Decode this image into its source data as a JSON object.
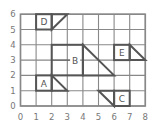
{
  "diagram": {
    "type": "grid-shapes",
    "x_ticks": [
      "0",
      "1",
      "2",
      "3",
      "4",
      "5",
      "6",
      "7",
      "8"
    ],
    "y_ticks": [
      "0",
      "1",
      "2",
      "3",
      "4",
      "5",
      "6"
    ],
    "grid": {
      "x_min": 0,
      "x_max": 8,
      "y_min": 0,
      "y_max": 6
    },
    "colors": {
      "grid": "#888888",
      "shape": "#555555",
      "text": "#555555",
      "axis_text": "#777777"
    },
    "shapes": [
      {
        "label": "A",
        "rect": [
          1,
          1,
          2,
          2
        ],
        "triangle": [
          [
            2,
            2
          ],
          [
            3,
            1
          ],
          [
            2,
            1
          ]
        ],
        "label_pos": [
          1.5,
          1.5
        ]
      },
      {
        "label": "B",
        "rect": [
          2,
          2,
          4,
          4
        ],
        "triangle": [
          [
            4,
            4
          ],
          [
            6,
            2
          ],
          [
            4,
            2
          ]
        ],
        "label_pos": [
          3.5,
          3
        ]
      },
      {
        "label": "C",
        "rect": [
          6,
          0,
          7,
          1
        ],
        "triangle": [
          [
            5,
            1
          ],
          [
            6,
            0
          ],
          [
            6,
            1
          ]
        ],
        "label_pos": [
          6.5,
          0.5
        ]
      },
      {
        "label": "D",
        "rect": [
          1,
          5,
          2,
          6
        ],
        "triangle": [
          [
            2,
            5
          ],
          [
            3,
            6
          ],
          [
            2,
            6
          ]
        ],
        "label_pos": [
          1.5,
          5.5
        ]
      },
      {
        "label": "E",
        "rect": [
          6,
          3,
          7,
          4
        ],
        "triangle": [
          [
            7,
            4
          ],
          [
            8,
            3
          ],
          [
            7,
            3
          ]
        ],
        "label_pos": [
          6.5,
          3.5
        ]
      }
    ]
  }
}
